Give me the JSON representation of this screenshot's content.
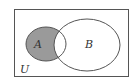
{
  "diagram": {
    "type": "venn",
    "universe_label": "U",
    "sets": [
      {
        "label": "A",
        "shaded": "A minus B"
      },
      {
        "label": "B",
        "shaded": "none"
      }
    ],
    "colors": {
      "stroke": "#555555",
      "shade": "#9a9a9a",
      "background": "#ffffff"
    }
  }
}
